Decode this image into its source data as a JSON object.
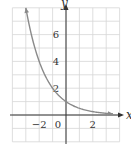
{
  "chart_data": {
    "type": "line",
    "title": "",
    "function": "y = (1/2)^x",
    "xlabel": "x",
    "ylabel": "y",
    "xlim": [
      -4,
      4
    ],
    "ylim": [
      -2,
      8
    ],
    "grid": true,
    "x_ticks": [
      -2,
      0,
      2
    ],
    "y_ticks": [
      2,
      4,
      6
    ],
    "x_tick_labels": [
      "−2",
      "0",
      "2"
    ],
    "y_tick_labels": [
      "2",
      "4",
      "6"
    ],
    "series": [
      {
        "name": "exponential decay",
        "x": [
          -3,
          -2,
          -1,
          0,
          1,
          2,
          3,
          3.5
        ],
        "values": [
          8,
          4,
          2,
          1,
          0.5,
          0.25,
          0.125,
          0.088
        ]
      }
    ],
    "colors": {
      "curve": "#8a8a8a",
      "grid": "#d6d6d6",
      "axis": "#333333"
    }
  }
}
